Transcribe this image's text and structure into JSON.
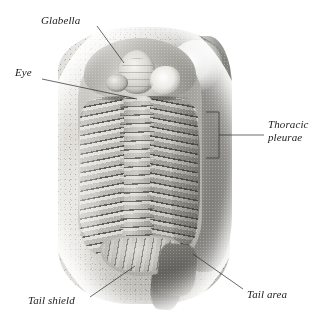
{
  "figure": {
    "kind": "labeled-photograph",
    "background_color": "#ffffff",
    "label_color": "#1b1b1b",
    "leader_color": "#2b2b2b"
  },
  "annotations": [
    {
      "id": "glabella",
      "label": "Glabella",
      "label_x": 41,
      "label_y": 14,
      "marker": "leader-line",
      "leader": {
        "x1": 97,
        "y1": 26,
        "x2": 124,
        "y2": 63
      }
    },
    {
      "id": "eye",
      "label": "Eye",
      "label_x": 15,
      "label_y": 66,
      "marker": "leader-line",
      "leader": {
        "x1": 42,
        "y1": 79,
        "x2": 137,
        "y2": 99
      }
    },
    {
      "id": "thoracic-pleurae",
      "label_line_1": "Thoracic",
      "label_line_2": "pleurae",
      "label_x": 268,
      "label_y": 118,
      "marker": "bracket",
      "bracket": {
        "x": 206,
        "y": 112,
        "width": 13,
        "height": 46
      },
      "leader": {
        "x1": 219,
        "y1": 135,
        "x2": 264,
        "y2": 135
      }
    },
    {
      "id": "tail-shield",
      "label": "Tail shield",
      "label_x": 28,
      "label_y": 294,
      "marker": "leader-line",
      "leader": {
        "x1": 90,
        "y1": 297,
        "x2": 135,
        "y2": 266
      }
    },
    {
      "id": "tail-area",
      "label": "Tail area",
      "label_x": 247,
      "label_y": 288,
      "marker": "leader-line",
      "leader": {
        "x1": 243,
        "y1": 289,
        "x2": 193,
        "y2": 254
      }
    }
  ],
  "specimen": {
    "parts": [
      {
        "name": "rock-matrix",
        "description": "grey limestone slab"
      },
      {
        "name": "cephalon",
        "description": "head shield"
      },
      {
        "name": "glabella",
        "description": "raised central lobe of head"
      },
      {
        "name": "eye",
        "description": "compound eye lobe on cheek"
      },
      {
        "name": "axial-lobe",
        "description": "central ridge of thorax"
      },
      {
        "name": "pleurae-left",
        "description": "left thoracic ribs"
      },
      {
        "name": "pleurae-right",
        "description": "right thoracic ribs"
      },
      {
        "name": "pygidium",
        "description": "tail shield"
      },
      {
        "name": "tail-area",
        "description": "broken tail region"
      }
    ],
    "thoracic_segment_count": 16
  }
}
